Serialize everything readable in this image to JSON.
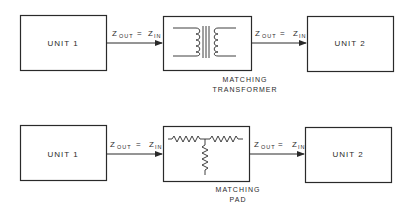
{
  "diagrams": [
    {
      "name": "transformer-matching",
      "unit_left": "UNIT 1",
      "unit_right": "UNIT 2",
      "link_left": {
        "z": "Z",
        "sub_out": "OUT",
        "eq": "=",
        "z2": "Z",
        "sub_in": "IN"
      },
      "link_right": {
        "z": "Z",
        "sub_out": "OUT",
        "eq": "=",
        "z2": "Z",
        "sub_in": "IN"
      },
      "middle_label": [
        "MATCHING",
        "TRANSFORMER"
      ],
      "middle_icon": "transformer-icon"
    },
    {
      "name": "pad-matching",
      "unit_left": "UNIT 1",
      "unit_right": "UNIT 2",
      "link_left": {
        "z": "Z",
        "sub_out": "OUT",
        "eq": "=",
        "z2": "Z",
        "sub_in": "IN"
      },
      "link_right": {
        "z": "Z",
        "sub_out": "OUT",
        "eq": "=",
        "z2": "Z",
        "sub_in": "IN"
      },
      "middle_label": [
        "MATCHING",
        "PAD"
      ],
      "middle_icon": "t-pad-resistor-icon"
    }
  ],
  "colors": {
    "line": "#2a2a2a",
    "background": "#ffffff"
  }
}
